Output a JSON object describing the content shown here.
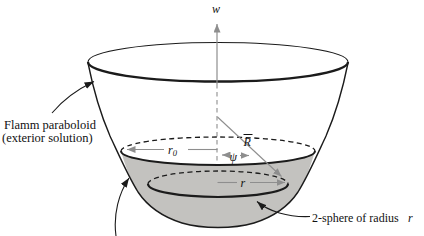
{
  "colors": {
    "outline": "#1b1b1b",
    "measure_gray": "#8e8e8e",
    "sphere_fill": "#c3c2bf",
    "background": "#ffffff",
    "text": "#111111"
  },
  "labels": {
    "w_axis": "w",
    "flamm_paraboloid_line1": "Flamm paraboloid",
    "flamm_paraboloid_line2": "(exterior solution)",
    "r0_symbol": "r",
    "r0_subscript": "0",
    "radius_of_curvature": "R",
    "radius_of_curvature_accent": "overbar",
    "psi_angle": "ψ",
    "r_symbol": "r",
    "two_sphere_text": "2-sphere of radius",
    "two_sphere_symbol": "r"
  }
}
